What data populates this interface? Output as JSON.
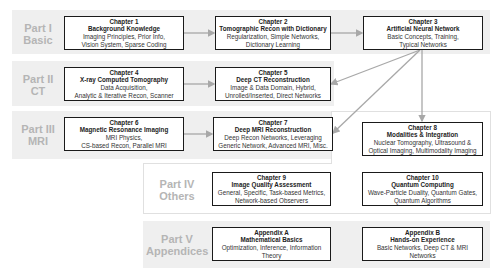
{
  "parts": [
    {
      "id": "part1",
      "label_line1": "Part I",
      "label_line2": "Basic"
    },
    {
      "id": "part2",
      "label_line1": "Part II",
      "label_line2": "CT"
    },
    {
      "id": "part3",
      "label_line1": "Part III",
      "label_line2": "MRI"
    },
    {
      "id": "part4",
      "label_line1": "Part IV",
      "label_line2": "Others"
    },
    {
      "id": "part5",
      "label_line1": "Part V",
      "label_line2": "Appendices"
    }
  ],
  "chapters": {
    "ch1": {
      "number": "Chapter 1",
      "title": "Background Knowledge",
      "topics1": "Imaging Principles, Prior Info,",
      "topics2": "Vision System, Sparse Coding"
    },
    "ch2": {
      "number": "Chapter 2",
      "title": "Tomographic Recon with Dictionary",
      "topics1": "Regularization, Simple Networks,",
      "topics2": "Dictionary Learning"
    },
    "ch3": {
      "number": "Chapter 3",
      "title": "Artificial Neural Network",
      "topics1": "Basic Concepts, Training,",
      "topics2": "Typical Networks"
    },
    "ch4": {
      "number": "Chapter 4",
      "title": "X-ray Computed Tomography",
      "topics1": "Data Acquisition,",
      "topics2": "Analytic & Iterative Recon, Scanner"
    },
    "ch5": {
      "number": "Chapter 5",
      "title": "Deep CT Reconstruction",
      "topics1": "Image & Data Domain, Hybrid,",
      "topics2": "Unrolled/Inserted, Direct Networks"
    },
    "ch6": {
      "number": "Chapter 6",
      "title": "Magnetic Resonance Imaging",
      "topics1": "MRI Physics,",
      "topics2": "CS-based Recon, Parallel MRI"
    },
    "ch7": {
      "number": "Chapter 7",
      "title": "Deep MRI Reconstruction",
      "topics1": "Deep Recon Networks, Leveraging",
      "topics2": "Generic Network, Advanced MRI, Misc."
    },
    "ch8": {
      "number": "Chapter 8",
      "title": "Modalities & Integration",
      "topics1": "Nuclear Tomography, Ultrasound &",
      "topics2": "Optical Imaging, Multimodality Imaging"
    },
    "ch9": {
      "number": "Chapter 9",
      "title": "Image Quality Assessment",
      "topics1": "General, Specific, Task-based Metrics,",
      "topics2": "Network-based Observers"
    },
    "ch10": {
      "number": "Chapter 10",
      "title": "Quantum Computing",
      "topics1": "Wave-Particle Duality, Quantum Gates,",
      "topics2": "Quantum Algorithms"
    },
    "appA": {
      "number": "Appendix A",
      "title": "Mathematical Basics",
      "topics1": "Optimization, Inference, Information",
      "topics2": "Theory"
    },
    "appB": {
      "number": "Appendix B",
      "title": "Hands-on Experience",
      "topics1": "Basic Networks, Deep CT & MRI",
      "topics2": "Networks"
    }
  },
  "colors": {
    "band": "#efefef",
    "label": "#b5b5b5",
    "box_border": "#1a1a1a",
    "arrow": "#a8a8a8"
  }
}
